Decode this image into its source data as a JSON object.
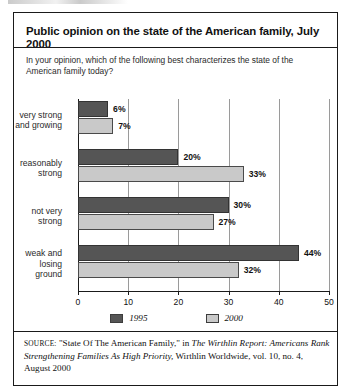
{
  "figure": {
    "title": "Public opinion on the state of the American family, July 2000",
    "question": "In your opinion, which of the following best characterizes the state of the American family today?"
  },
  "legend": {
    "items": [
      {
        "label": "1995",
        "color": "#555555"
      },
      {
        "label": "2000",
        "color": "#c9c9c9"
      }
    ]
  },
  "source": {
    "label": "SOURCE:",
    "part1": " \"State Of The American Family,\" in ",
    "italic1": "The Wirthlin Report: Americans Rank Strengthening Families As High Priority,",
    "part2": " Wirthlin Worldwide, vol. 10, no. 4, August 2000"
  },
  "axis": {
    "ticks": [
      "0",
      "10",
      "20",
      "30",
      "40",
      "50"
    ],
    "values": [
      0,
      10,
      20,
      30,
      40,
      50
    ]
  },
  "categories": [
    {
      "label": "very strong\nand growing",
      "v1995": 6,
      "v2000": 7,
      "l1995": "6%",
      "l2000": "7%"
    },
    {
      "label": "reasonably\nstrong",
      "v1995": 20,
      "v2000": 33,
      "l1995": "20%",
      "l2000": "33%"
    },
    {
      "label": "not very\nstrong",
      "v1995": 30,
      "v2000": 27,
      "l1995": "30%",
      "l2000": "27%"
    },
    {
      "label": "weak and\nlosing\nground",
      "v1995": 44,
      "v2000": 32,
      "l1995": "44%",
      "l2000": "32%"
    }
  ],
  "chart_data": {
    "type": "bar",
    "orientation": "horizontal",
    "title": "Public opinion on the state of the American family, July 2000",
    "subtitle": "In your opinion, which of the following best characterizes the state of the American family today?",
    "categories": [
      "very strong and growing",
      "reasonably strong",
      "not very strong",
      "weak and losing ground"
    ],
    "series": [
      {
        "name": "1995",
        "color": "#555555",
        "values": [
          6,
          20,
          30,
          44
        ]
      },
      {
        "name": "2000",
        "color": "#c9c9c9",
        "values": [
          7,
          33,
          27,
          32
        ]
      }
    ],
    "xlabel": "",
    "ylabel": "",
    "xlim": [
      0,
      50
    ],
    "xticks": [
      0,
      10,
      20,
      30,
      40,
      50
    ],
    "grid": true,
    "legend_position": "bottom",
    "data_labels": [
      "6%",
      "7%",
      "20%",
      "33%",
      "30%",
      "27%",
      "44%",
      "32%"
    ]
  }
}
